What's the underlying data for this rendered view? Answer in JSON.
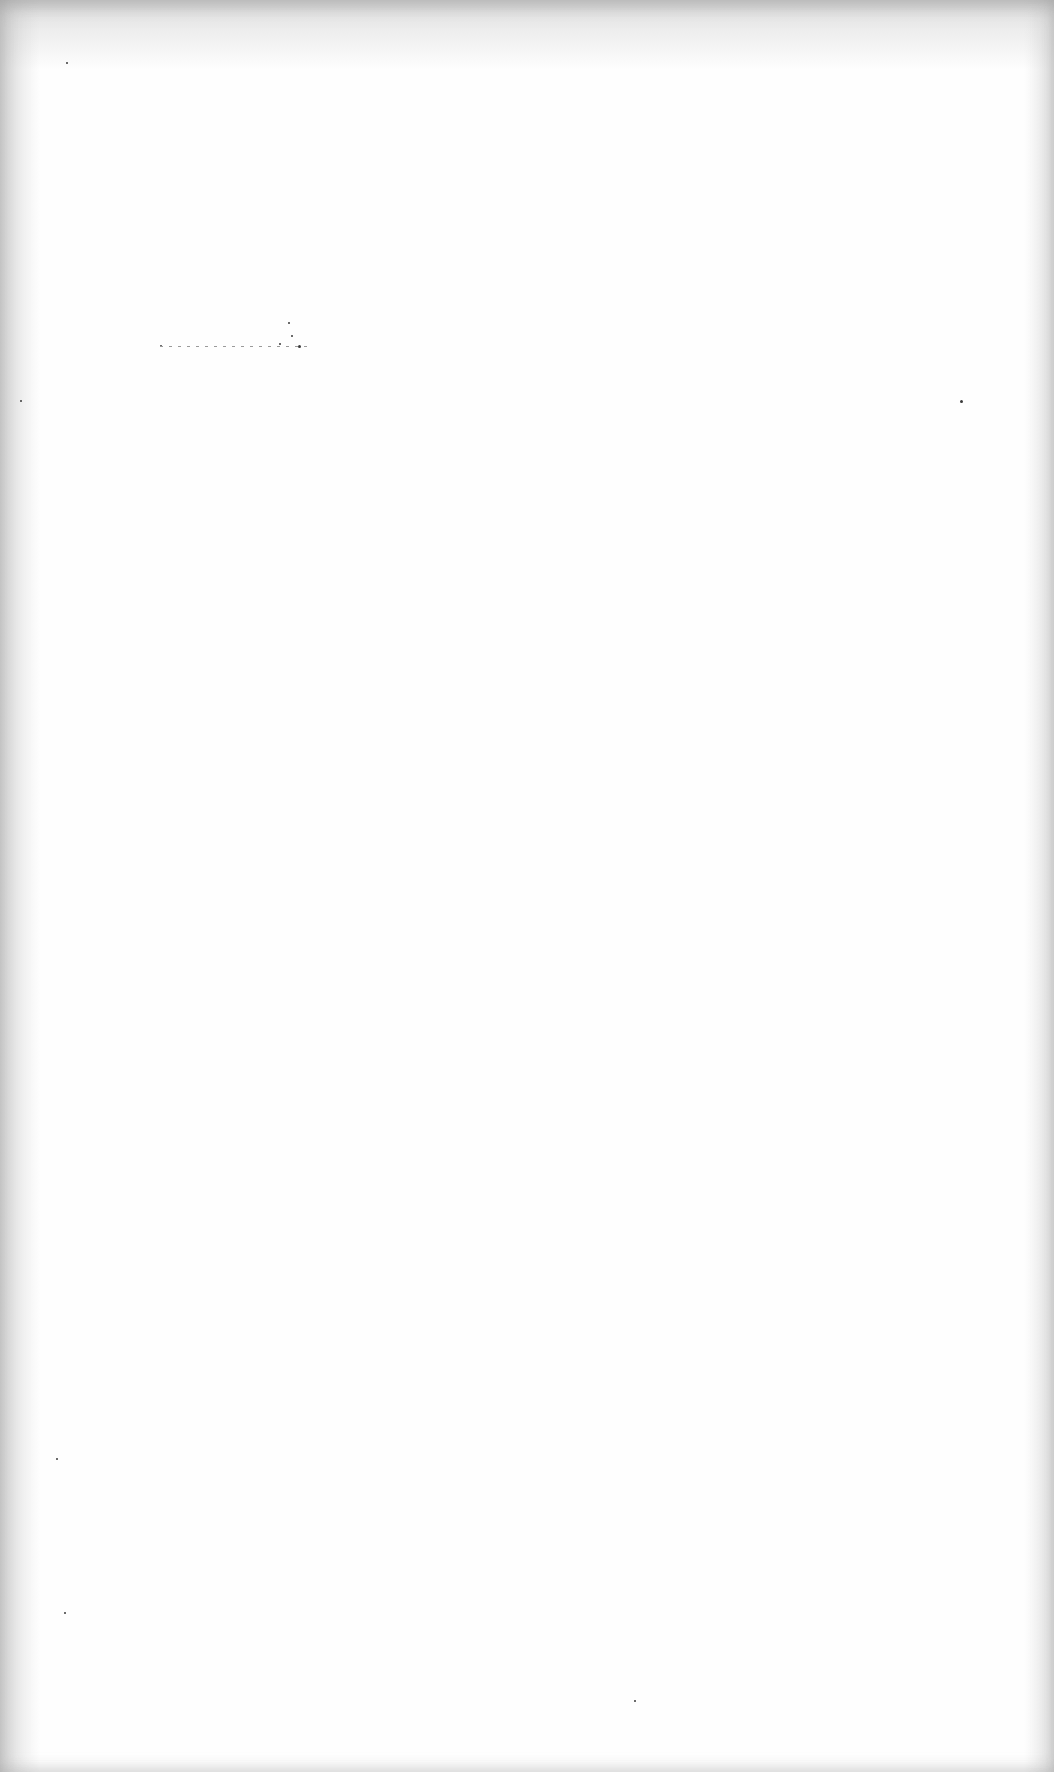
{
  "page": {
    "type": "blank scanned page",
    "background_color": "#fefefe",
    "edge_shadow_color": "#b4b4b4"
  },
  "specks": [
    {
      "x": 288,
      "y": 322,
      "size": 2
    },
    {
      "x": 291,
      "y": 335,
      "size": 2
    },
    {
      "x": 298,
      "y": 345,
      "size": 3
    },
    {
      "x": 279,
      "y": 343,
      "size": 2
    },
    {
      "x": 160,
      "y": 345,
      "size": 2
    },
    {
      "x": 960,
      "y": 400,
      "size": 3
    },
    {
      "x": 20,
      "y": 400,
      "size": 2
    },
    {
      "x": 66,
      "y": 62,
      "size": 2
    },
    {
      "x": 64,
      "y": 1612,
      "size": 2
    },
    {
      "x": 56,
      "y": 1458,
      "size": 2
    },
    {
      "x": 634,
      "y": 1700,
      "size": 2
    }
  ],
  "speck_line": {
    "x": 160,
    "y": 346,
    "width": 150
  }
}
